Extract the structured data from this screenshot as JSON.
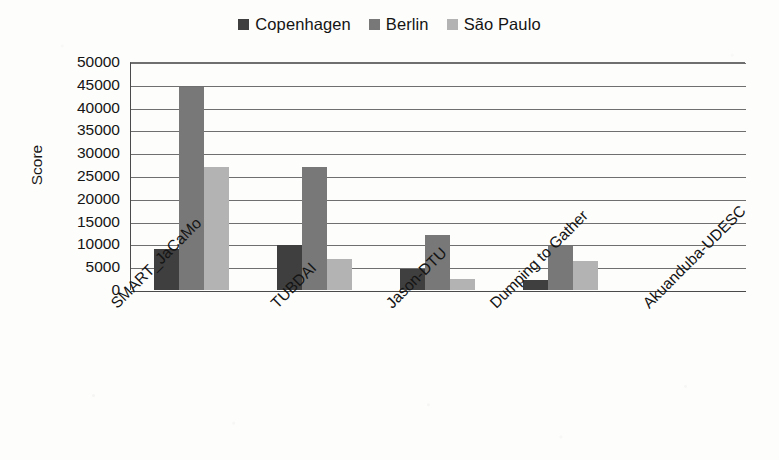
{
  "chart_data": {
    "type": "bar",
    "title": "",
    "xlabel": "",
    "ylabel": "Score",
    "ylim": [
      0,
      50000
    ],
    "ytick_step": 5000,
    "yticks": [
      "50000",
      "45000",
      "40000",
      "35000",
      "30000",
      "25000",
      "20000",
      "15000",
      "10000",
      "5000",
      "0"
    ],
    "grid": true,
    "legend_position": "top-center",
    "categories": [
      "SMART_JaCaMo",
      "TUBDAI",
      "Jason-DTU",
      "Dumping to Gather",
      "Akuanduba-UDESC"
    ],
    "series": [
      {
        "name": "Copenhagen",
        "color": "#3f3f3f",
        "values": [
          9000,
          9800,
          4700,
          2200,
          0
        ]
      },
      {
        "name": "Berlin",
        "color": "#787878",
        "values": [
          44500,
          27000,
          12000,
          9700,
          0
        ]
      },
      {
        "name": "São Paulo",
        "color": "#b3b3b3",
        "values": [
          27000,
          6700,
          2500,
          6300,
          0
        ]
      }
    ]
  },
  "legend": {
    "entries": [
      {
        "label": "Copenhagen",
        "color": "#3f3f3f"
      },
      {
        "label": "Berlin",
        "color": "#787878"
      },
      {
        "label": "São Paulo",
        "color": "#b3b3b3"
      }
    ]
  },
  "axis": {
    "y_title": "Score"
  },
  "colors": {
    "copenhagen": "#3f3f3f",
    "berlin": "#787878",
    "sao_paulo": "#b3b3b3",
    "gridline": "#6f6f6f",
    "axis": "#4a4a4a",
    "background": "#fdfdfb"
  }
}
